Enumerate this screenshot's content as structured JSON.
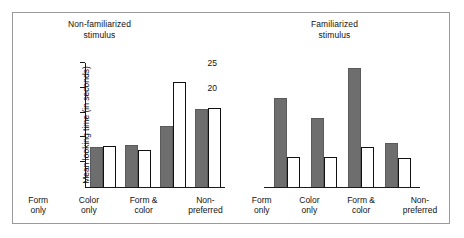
{
  "chart_data": {
    "type": "bar",
    "title": "",
    "xlabel": "",
    "ylabel": "Mean looking time (in seconds)",
    "ylim": [
      0,
      25
    ],
    "yticks": [
      5,
      10,
      15,
      20,
      25
    ],
    "grid": false,
    "legend": "none",
    "categories": [
      "Form\nonly",
      "Color\nonly",
      "Form &\ncolor",
      "Non-\npreferred"
    ],
    "panels": [
      {
        "title": "Non-familiarized\nstimulus",
        "series": [
          {
            "name": "filled",
            "values": [
              8.1,
              8.5,
              12.3,
              15.8
            ]
          },
          {
            "name": "open",
            "values": [
              8.2,
              7.5,
              21.2,
              15.9
            ]
          }
        ]
      },
      {
        "title": "Familiarized\nstimulus",
        "series": [
          {
            "name": "filled",
            "values": [
              18.0,
              14.0,
              24.0,
              8.8
            ]
          },
          {
            "name": "open",
            "values": [
              6.0,
              6.0,
              8.0,
              5.8
            ]
          }
        ]
      }
    ],
    "colors": {
      "filled_bar": "#6e6e6e",
      "open_bar_fill": "#ffffff",
      "open_bar_stroke": "#101010",
      "axis": "#1a1a1a",
      "frame": "#9a9a9a",
      "background": "#ffffff"
    }
  }
}
